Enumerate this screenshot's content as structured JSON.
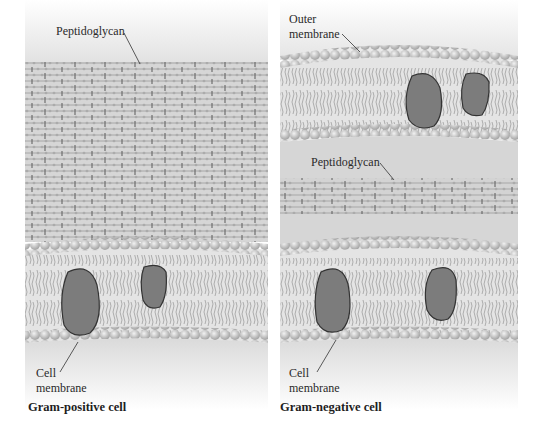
{
  "figure": {
    "left_panel": {
      "caption": "Gram-positive cell",
      "labels": {
        "peptidoglycan": "Peptidoglycan",
        "cell_membrane_line1": "Cell",
        "cell_membrane_line2": "membrane"
      },
      "layers": [
        "thick peptidoglycan wall",
        "cell membrane (lipid bilayer with 2 proteins)"
      ]
    },
    "right_panel": {
      "caption": "Gram-negative cell",
      "labels": {
        "outer_membrane_line1": "Outer",
        "outer_membrane_line2": "membrane",
        "peptidoglycan": "Peptidoglycan",
        "cell_membrane_line1": "Cell",
        "cell_membrane_line2": "membrane"
      },
      "layers": [
        "outer membrane (lipid bilayer with 2 proteins)",
        "thin peptidoglycan layer",
        "cell membrane (lipid bilayer with 2 proteins)"
      ]
    },
    "colors": {
      "head": "#c9c9c9",
      "tail": "#9a9a9a",
      "protein": "#7a7a7a",
      "protein_edge": "#3a3a3a",
      "mesh": "#8a8a8a",
      "bg_gray": "#d8d8d8"
    }
  }
}
